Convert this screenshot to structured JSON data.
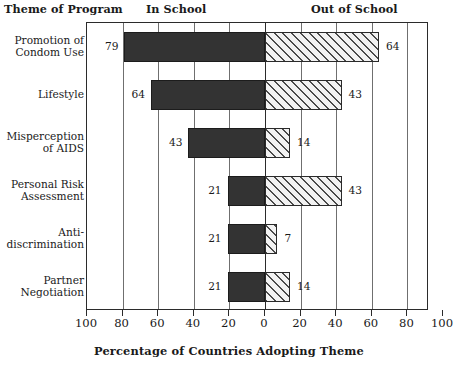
{
  "header": {
    "theme_label": "Theme of Program",
    "in_school_label": "In School",
    "out_of_school_label": "Out of School"
  },
  "axis": {
    "title": "Percentage of Countries Adopting Theme",
    "tick_labels": [
      "100",
      "80",
      "60",
      "40",
      "20",
      "0",
      "20",
      "40",
      "60",
      "80",
      "100"
    ]
  },
  "rows": [
    {
      "label": "Promotion of\nCondom Use",
      "in_school": 79,
      "out_of_school": 64,
      "in_school_text": "79",
      "out_of_school_text": "64"
    },
    {
      "label": "Lifestyle",
      "in_school": 64,
      "out_of_school": 43,
      "in_school_text": "64",
      "out_of_school_text": "43"
    },
    {
      "label": "Misperception\nof AIDS",
      "in_school": 43,
      "out_of_school": 14,
      "in_school_text": "43",
      "out_of_school_text": "14"
    },
    {
      "label": "Personal Risk\nAssessment",
      "in_school": 21,
      "out_of_school": 43,
      "in_school_text": "21",
      "out_of_school_text": "43"
    },
    {
      "label": "Anti-\ndiscrimination",
      "in_school": 21,
      "out_of_school": 7,
      "in_school_text": "21",
      "out_of_school_text": "7"
    },
    {
      "label": "Partner\nNegotiation",
      "in_school": 21,
      "out_of_school": 14,
      "in_school_text": "21",
      "out_of_school_text": "14"
    }
  ],
  "chart_data": {
    "type": "bar",
    "orientation": "horizontal",
    "layout": "bidirectional-tornado",
    "title": "",
    "xlabel": "Percentage of Countries Adopting Theme",
    "ylabel": "Theme of Program",
    "categories": [
      "Promotion of Condom Use",
      "Lifestyle",
      "Misperception of AIDS",
      "Personal Risk Assessment",
      "Anti-discrimination",
      "Partner Negotiation"
    ],
    "series": [
      {
        "name": "In School",
        "direction": "left",
        "values": [
          79,
          64,
          43,
          21,
          21,
          21
        ],
        "fill": "solid-dark",
        "color": "#333333"
      },
      {
        "name": "Out of School",
        "direction": "right",
        "values": [
          64,
          43,
          14,
          43,
          7,
          14
        ],
        "fill": "diagonal-hatch",
        "color": "#f2f2f2"
      }
    ],
    "xlim_left": [
      0,
      100
    ],
    "xlim_right": [
      0,
      100
    ],
    "xticks_left": [
      100,
      80,
      60,
      40,
      20,
      0
    ],
    "xticks_right": [
      0,
      20,
      40,
      60,
      80,
      100
    ],
    "tick_interval": 20,
    "grid": true,
    "grid_axis": "x",
    "legend": "column-headers",
    "data_labels": true,
    "units": "percent"
  }
}
